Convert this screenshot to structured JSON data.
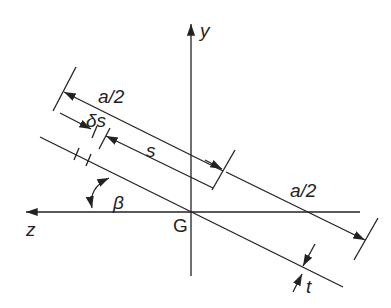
{
  "diagram": {
    "type": "thin-walled inclined plate cross-section",
    "axes": {
      "y_label": "y",
      "z_label": "z",
      "origin_label": "G"
    },
    "dimensions": {
      "half_length_upper": "a/2",
      "half_length_lower": "a/2",
      "distance": "s",
      "element": "δs",
      "thickness": "t",
      "angle": "β"
    },
    "colors": {
      "line": "#222222",
      "background": "#ffffff"
    }
  }
}
